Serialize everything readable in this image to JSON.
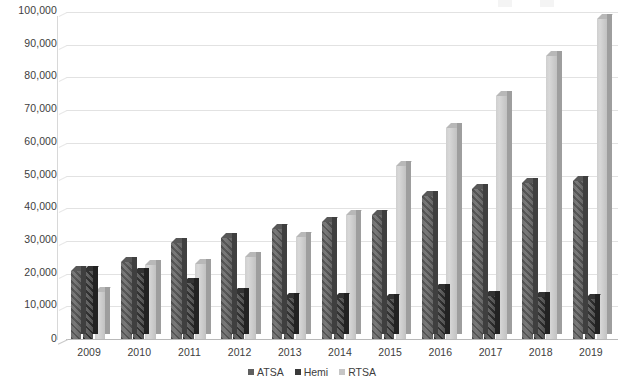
{
  "chart_data": {
    "type": "bar",
    "title": "",
    "subtitle": "",
    "xlabel": "",
    "ylabel": "",
    "grid": true,
    "legend_position": "bottom",
    "three_d": true,
    "ylim": [
      0,
      100000
    ],
    "ytick_step": 10000,
    "categories": [
      "2009",
      "2010",
      "2011",
      "2012",
      "2013",
      "2014",
      "2015",
      "2016",
      "2017",
      "2018",
      "2019"
    ],
    "ytick_labels": [
      "100,000",
      "90,000",
      "80,000",
      "70,000",
      "60,000",
      "50,000",
      "40,000",
      "30,000",
      "20,000",
      "10,000",
      "0"
    ],
    "ytick_values": [
      100000,
      90000,
      80000,
      70000,
      60000,
      50000,
      40000,
      30000,
      20000,
      10000,
      0
    ],
    "series": [
      {
        "name": "ATSA",
        "color": "#5f5f5f",
        "values": [
          20800,
          23600,
          29400,
          30800,
          33600,
          35800,
          37800,
          43600,
          46000,
          47800,
          48400
        ]
      },
      {
        "name": "Hemi",
        "color": "#3a3a3a",
        "values": [
          20900,
          20200,
          17000,
          14200,
          12400,
          12400,
          12300,
          15200,
          13200,
          12700,
          12200
        ]
      },
      {
        "name": "RTSA",
        "color": "#c6c6c6",
        "values": [
          14400,
          22700,
          23000,
          25200,
          31200,
          38000,
          52800,
          64400,
          74400,
          86400,
          98000
        ]
      }
    ]
  },
  "legend": {
    "items": [
      {
        "label": "ATSA"
      },
      {
        "label": "Hemi"
      },
      {
        "label": "RTSA"
      }
    ]
  }
}
